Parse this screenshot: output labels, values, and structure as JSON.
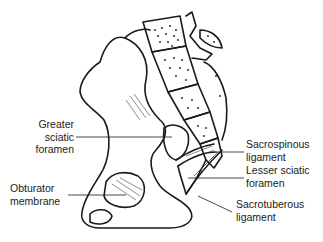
{
  "diagram": {
    "labels": {
      "greater_sciatic_foramen": {
        "line1": "Greater",
        "line2": "sciatic",
        "line3": "foramen"
      },
      "obturator_membrane": {
        "line1": "Obturator",
        "line2": "membrane"
      },
      "sacrospinous_ligament": {
        "line1": "Sacrospinous",
        "line2": "ligament"
      },
      "lesser_sciatic_foramen": {
        "line1": "Lesser sciatic",
        "line2": "foramen"
      },
      "sacrotuberous_ligament": {
        "line1": "Sacrotuberous",
        "line2": "ligament"
      }
    },
    "colors": {
      "ink": "#1a1a1a",
      "background": "#ffffff"
    }
  }
}
